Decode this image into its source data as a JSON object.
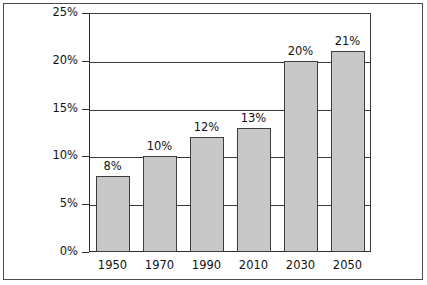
{
  "chart_data": {
    "type": "bar",
    "title": "",
    "subtitle": "",
    "xlabel": "",
    "ylabel": "",
    "categories": [
      "1950",
      "1970",
      "1990",
      "2010",
      "2030",
      "2050"
    ],
    "values": [
      8,
      10,
      12,
      13,
      20,
      21
    ],
    "value_labels": [
      "8%",
      "10%",
      "12%",
      "13%",
      "20%",
      "21%"
    ],
    "ylim": [
      0,
      25
    ],
    "ytick_values": [
      0,
      5,
      10,
      15,
      20,
      25
    ],
    "ytick_labels": [
      "0%",
      "5%",
      "10%",
      "15%",
      "20%",
      "25%"
    ],
    "grid": "horizontal",
    "legend": "none",
    "colors": {
      "bar_fill": "#c8c8c8",
      "bar_border": "#3d3d3d",
      "gridline": "#3a3a3a",
      "axis": "#2b2b2b",
      "text": "#121212",
      "background": "#ffffff",
      "outer_frame": "#4a4a4a"
    }
  }
}
